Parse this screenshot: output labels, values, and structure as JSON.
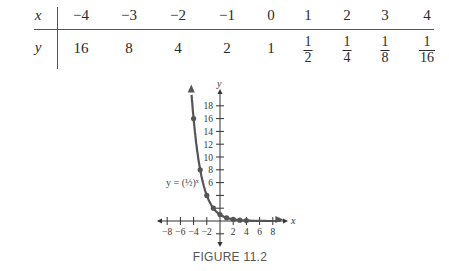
{
  "table": {
    "x_label": "x",
    "y_label": "y",
    "x_values": [
      "−4",
      "−3",
      "−2",
      "−1",
      "0",
      "1",
      "2",
      "3",
      "4"
    ],
    "y_values": [
      {
        "type": "int",
        "text": "16"
      },
      {
        "type": "int",
        "text": "8"
      },
      {
        "type": "int",
        "text": "4"
      },
      {
        "type": "int",
        "text": "2"
      },
      {
        "type": "int",
        "text": "1"
      },
      {
        "type": "frac",
        "num": "1",
        "den": "2"
      },
      {
        "type": "frac",
        "num": "1",
        "den": "4"
      },
      {
        "type": "frac",
        "num": "1",
        "den": "8"
      },
      {
        "type": "frac",
        "num": "1",
        "den": "16"
      }
    ]
  },
  "graph": {
    "x_axis_label": "x",
    "y_axis_label": "y",
    "x_tick_labels": [
      "−8",
      "−6",
      "−4",
      "−2",
      "2",
      "4",
      "6",
      "8"
    ],
    "y_tick_labels": [
      "18",
      "16",
      "14",
      "12",
      "10",
      "8",
      "6"
    ],
    "curve_label": "y = (½)ˣ",
    "curve_color": "#555555"
  },
  "caption": "FIGURE 11.2",
  "chart_data": {
    "type": "line",
    "title": "FIGURE 11.2",
    "function": "y = (1/2)^x",
    "x": [
      -4,
      -3,
      -2,
      -1,
      0,
      1,
      2,
      3,
      4
    ],
    "values": [
      16,
      8,
      4,
      2,
      1,
      0.5,
      0.25,
      0.125,
      0.0625
    ],
    "xlabel": "x",
    "ylabel": "y",
    "xlim": [
      -9,
      10
    ],
    "ylim": [
      -3,
      19
    ],
    "x_ticks": [
      -8,
      -6,
      -4,
      -2,
      2,
      4,
      6,
      8
    ],
    "y_ticks": [
      6,
      8,
      10,
      12,
      14,
      16,
      18
    ],
    "grid": false,
    "legend": "none"
  }
}
